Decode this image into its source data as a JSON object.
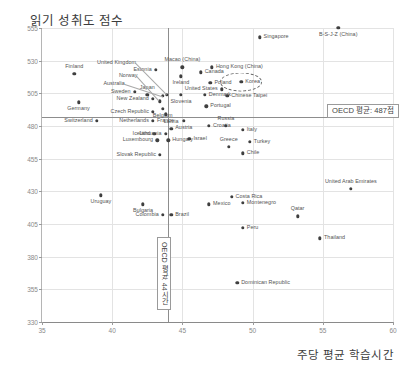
{
  "chart_data": {
    "type": "scatter",
    "title": "읽기 성취도 점수",
    "xlabel": "주당 평균 학습시간",
    "ylabel": "읽기 성취도 점수",
    "xlim": [
      35,
      60
    ],
    "ylim": [
      330,
      555
    ],
    "xticks": [
      "35",
      "40",
      "45",
      "50",
      "55",
      "60"
    ],
    "yticks": [
      "555",
      "530",
      "505",
      "480",
      "455",
      "430",
      "405",
      "380",
      "355",
      "330"
    ],
    "grid": true,
    "legend": "none",
    "reference_lines": {
      "y_mean": {
        "value": 487,
        "label": "OECD 평균: 487점"
      },
      "x_mean": {
        "value": 44,
        "label": "OECD 평균: 44시간"
      }
    },
    "highlight": {
      "name": "Korea",
      "style": "dashed-ellipse"
    },
    "points": [
      {
        "label": "Finland",
        "x": 37.3,
        "y": 520.0,
        "side": "c",
        "dx": 0,
        "dy": -7
      },
      {
        "label": "Germany",
        "x": 37.6,
        "y": 498.0,
        "side": "c",
        "dx": 0,
        "dy": 7
      },
      {
        "label": "Switzerland",
        "x": 38.9,
        "y": 484.0,
        "side": "r",
        "dx": -4,
        "dy": 0
      },
      {
        "label": "Uruguay",
        "x": 39.2,
        "y": 427.0,
        "side": "c",
        "dx": 0,
        "dy": 7
      },
      {
        "label": "Sweden",
        "x": 41.6,
        "y": 506.0,
        "side": "r",
        "dx": -4,
        "dy": 0
      },
      {
        "label": "Japan",
        "x": 42.5,
        "y": 504.0,
        "side": "c",
        "dx": 0,
        "dy": -7
      },
      {
        "label": "New Zealand",
        "x": 42.9,
        "y": 501.0,
        "side": "r",
        "dx": -4,
        "dy": 0
      },
      {
        "label": "Czech Republic",
        "x": 42.9,
        "y": 491.0,
        "side": "r",
        "dx": -4,
        "dy": 0
      },
      {
        "label": "Netherlands",
        "x": 42.9,
        "y": 484.0,
        "side": "r",
        "dx": -4,
        "dy": 0
      },
      {
        "label": "Iceland",
        "x": 43.0,
        "y": 474.0,
        "side": "r",
        "dx": -4,
        "dy": 0
      },
      {
        "label": "Luxembourg",
        "x": 43.2,
        "y": 469.0,
        "side": "r",
        "dx": -4,
        "dy": 0
      },
      {
        "label": "Slovak Republic",
        "x": 43.4,
        "y": 458.0,
        "side": "r",
        "dx": -4,
        "dy": 0
      },
      {
        "label": "Bulgaria",
        "x": 42.2,
        "y": 420.0,
        "side": "c",
        "dx": 0,
        "dy": 7
      },
      {
        "label": "Australia",
        "x": 43.6,
        "y": 503.0,
        "side": "leader",
        "lx": 40.9,
        "ly": 512.5
      },
      {
        "label": "Norway",
        "x": 43.4,
        "y": 499.0,
        "side": "leader",
        "lx": 41.8,
        "ly": 518.0
      },
      {
        "label": "Estonia",
        "x": 43.1,
        "y": 523.0,
        "side": "r",
        "dx": -4,
        "dy": 0
      },
      {
        "label": "United Kingdom",
        "x": 43.9,
        "y": 504.0,
        "side": "leader",
        "lx": 41.7,
        "ly": 528.0
      },
      {
        "label": "Belgium",
        "x": 43.6,
        "y": 493.0,
        "side": "c",
        "dx": 0,
        "dy": 7
      },
      {
        "label": "France",
        "x": 43.8,
        "y": 489.0,
        "side": "c",
        "dx": 0,
        "dy": 7
      },
      {
        "label": "Latvia",
        "x": 44.2,
        "y": 478.0,
        "side": "c",
        "dx": 0,
        "dy": -7
      },
      {
        "label": "Lithuania",
        "x": 43.8,
        "y": 474.0,
        "side": "r",
        "dx": -4,
        "dy": 0
      },
      {
        "label": "Hungary",
        "x": 44.0,
        "y": 469.0,
        "side": "l",
        "dx": 4,
        "dy": 0
      },
      {
        "label": "Colombia",
        "x": 43.6,
        "y": 412.0,
        "side": "r",
        "dx": -4,
        "dy": 0
      },
      {
        "label": "Brazil",
        "x": 44.2,
        "y": 412.0,
        "side": "l",
        "dx": 4,
        "dy": 0
      },
      {
        "label": "Macao (China)",
        "x": 45.0,
        "y": 525.0,
        "side": "c",
        "dx": 0,
        "dy": -7
      },
      {
        "label": "Ireland",
        "x": 44.9,
        "y": 518.0,
        "side": "c",
        "dx": 0,
        "dy": 7
      },
      {
        "label": "Slovenia",
        "x": 44.9,
        "y": 504.0,
        "side": "c",
        "dx": 0,
        "dy": 7
      },
      {
        "label": "Austria",
        "x": 45.1,
        "y": 484.0,
        "side": "c",
        "dx": 0,
        "dy": 7
      },
      {
        "label": "Israel",
        "x": 45.5,
        "y": 470.0,
        "side": "l",
        "dx": 4,
        "dy": 0
      },
      {
        "label": "Canada",
        "x": 46.3,
        "y": 521.0,
        "side": "l",
        "dx": 4,
        "dy": 0
      },
      {
        "label": "Hong Kong (China)",
        "x": 47.1,
        "y": 525.0,
        "side": "l",
        "dx": 4,
        "dy": 0
      },
      {
        "label": "Poland",
        "x": 47.0,
        "y": 513.0,
        "side": "l",
        "dx": 4,
        "dy": 0
      },
      {
        "label": "Denmark",
        "x": 46.6,
        "y": 504.0,
        "side": "l",
        "dx": 4,
        "dy": 0
      },
      {
        "label": "Portugal",
        "x": 46.7,
        "y": 495.0,
        "side": "l",
        "dx": 4,
        "dy": 0
      },
      {
        "label": "Croatia",
        "x": 46.9,
        "y": 480.0,
        "side": "l",
        "dx": 4,
        "dy": 0
      },
      {
        "label": "Russia",
        "x": 48.1,
        "y": 480.0,
        "side": "c",
        "dx": 0,
        "dy": -7
      },
      {
        "label": "United States",
        "x": 47.8,
        "y": 508.0,
        "side": "r",
        "dx": -4,
        "dy": 0
      },
      {
        "label": "Chinese Taipei",
        "x": 48.2,
        "y": 503.0,
        "side": "l",
        "dx": 4,
        "dy": 0
      },
      {
        "label": "Korea",
        "x": 49.2,
        "y": 514.0,
        "side": "l",
        "dx": 4,
        "dy": 0
      },
      {
        "label": "Singapore",
        "x": 50.5,
        "y": 548.0,
        "side": "l",
        "dx": 4,
        "dy": 0
      },
      {
        "label": "B-S-J-Z (China)",
        "x": 56.1,
        "y": 555.0,
        "side": "c",
        "dx": 0,
        "dy": 7
      },
      {
        "label": "Italy",
        "x": 49.3,
        "y": 477.0,
        "side": "l",
        "dx": 4,
        "dy": 0
      },
      {
        "label": "Greece",
        "x": 48.3,
        "y": 464.0,
        "side": "c",
        "dx": 0,
        "dy": -7
      },
      {
        "label": "Turkey",
        "x": 49.8,
        "y": 468.0,
        "side": "l",
        "dx": 4,
        "dy": 0
      },
      {
        "label": "Chile",
        "x": 49.3,
        "y": 459.0,
        "side": "l",
        "dx": 4,
        "dy": 0
      },
      {
        "label": "Mexico",
        "x": 46.9,
        "y": 420.0,
        "side": "l",
        "dx": 4,
        "dy": 0
      },
      {
        "label": "Costa Rica",
        "x": 48.5,
        "y": 426.0,
        "side": "l",
        "dx": 4,
        "dy": 0
      },
      {
        "label": "Montenegro",
        "x": 49.3,
        "y": 421.0,
        "side": "l",
        "dx": 4,
        "dy": 0
      },
      {
        "label": "Peru",
        "x": 49.3,
        "y": 402.0,
        "side": "l",
        "dx": 4,
        "dy": 0
      },
      {
        "label": "Qatar",
        "x": 53.2,
        "y": 411.0,
        "side": "c",
        "dx": 0,
        "dy": -7
      },
      {
        "label": "Thailand",
        "x": 54.8,
        "y": 394.0,
        "side": "l",
        "dx": 4,
        "dy": 0
      },
      {
        "label": "United Arab Emirates",
        "x": 57.0,
        "y": 432.0,
        "side": "c",
        "dx": 0,
        "dy": -7
      },
      {
        "label": "Dominican Republic",
        "x": 48.9,
        "y": 360.0,
        "side": "l",
        "dx": 4,
        "dy": 0
      }
    ]
  }
}
